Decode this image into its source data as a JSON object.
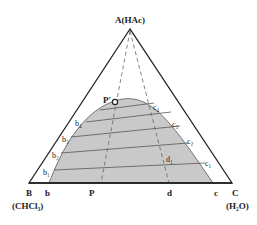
{
  "diagram": {
    "type": "ternary-phase-diagram",
    "vertices": {
      "A": {
        "label": "A(HAc)"
      },
      "B": {
        "label": "B",
        "sub_label": "(CHCl₃)"
      },
      "C": {
        "label": "C",
        "sub_label": "(H₂O)"
      }
    },
    "base_points": {
      "b": "b",
      "P": "P",
      "d": "d",
      "c": "c"
    },
    "plait_point": "P′",
    "left_branch": [
      "b₁",
      "b₂",
      "b₃",
      "b₄"
    ],
    "right_branch": [
      "c₁",
      "c₂",
      "c₃",
      "c₄"
    ],
    "inner_point": "d₁",
    "colors": {
      "region_fill": "#c9c9c9",
      "outline": "#222222",
      "tie_line": "#555555"
    }
  }
}
